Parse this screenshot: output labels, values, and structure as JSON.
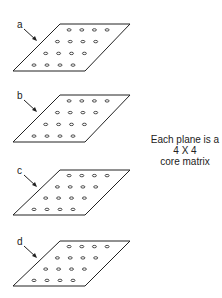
{
  "diagram": {
    "stroke_color": "#222222",
    "background": "#ffffff",
    "planes": [
      {
        "label": "a",
        "top_y": 24,
        "bottom_y": 71
      },
      {
        "label": "b",
        "top_y": 95,
        "bottom_y": 142
      },
      {
        "label": "c",
        "top_y": 170,
        "bottom_y": 215
      },
      {
        "label": "d",
        "top_y": 241,
        "bottom_y": 286
      }
    ],
    "matrix": {
      "rows": 4,
      "cols": 4
    },
    "caption": {
      "line1": "Each plane is a",
      "line2": "4 X 4",
      "line3": "core matrix"
    }
  }
}
